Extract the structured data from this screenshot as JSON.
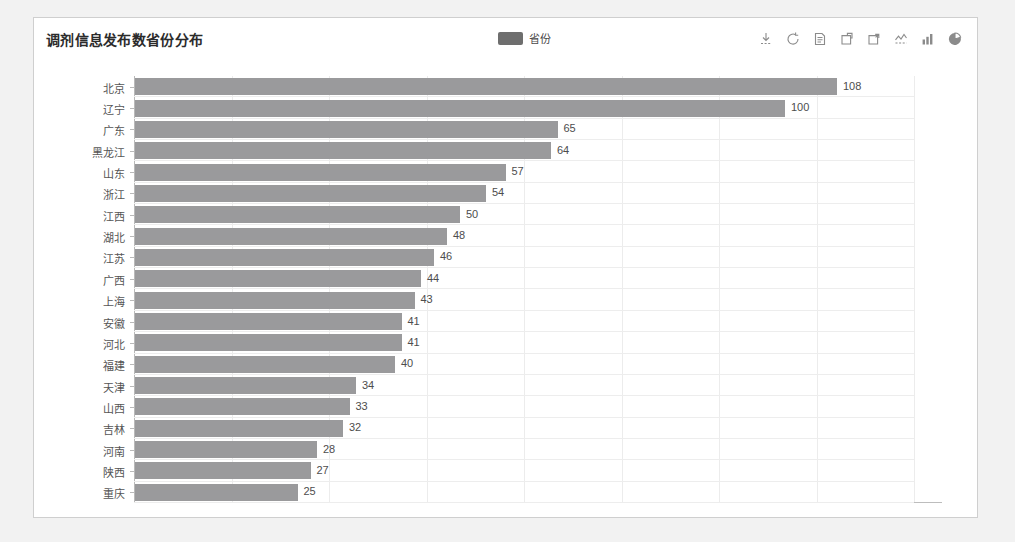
{
  "panel": {
    "title": "调剂信息发布数省份分布"
  },
  "legend": {
    "items": [
      {
        "label": "省份",
        "color": "#6e6e6e"
      }
    ]
  },
  "toolbox": {
    "icons": [
      {
        "name": "download-icon",
        "title": "保存为图片"
      },
      {
        "name": "refresh-icon",
        "title": "刷新"
      },
      {
        "name": "data-view-icon",
        "title": "数据视图"
      },
      {
        "name": "zoom-select-icon",
        "title": "区域缩放"
      },
      {
        "name": "zoom-reset-icon",
        "title": "区域缩放还原"
      },
      {
        "name": "line-chart-icon",
        "title": "切换为折线图"
      },
      {
        "name": "bar-chart-icon",
        "title": "切换为柱状图"
      },
      {
        "name": "pie-chart-icon",
        "title": "切换为饼图"
      }
    ]
  },
  "chart_data": {
    "type": "bar",
    "orientation": "horizontal",
    "title": "调剂信息发布数省份分布",
    "xlabel": "",
    "ylabel": "",
    "grid": true,
    "legend_position": "top-center",
    "series_name": "省份",
    "bar_color": "#9a9a9c",
    "xlim": [
      0,
      120
    ],
    "xticks": [
      0,
      15,
      30,
      45,
      60,
      75,
      90,
      105,
      120
    ],
    "categories": [
      "北京",
      "辽宁",
      "广东",
      "黑龙江",
      "山东",
      "浙江",
      "江西",
      "湖北",
      "江苏",
      "广西",
      "上海",
      "安徽",
      "河北",
      "福建",
      "天津",
      "山西",
      "吉林",
      "河南",
      "陕西",
      "重庆"
    ],
    "values": [
      108,
      100,
      65,
      64,
      57,
      54,
      50,
      48,
      46,
      44,
      43,
      41,
      41,
      40,
      34,
      33,
      32,
      28,
      27,
      25
    ]
  }
}
